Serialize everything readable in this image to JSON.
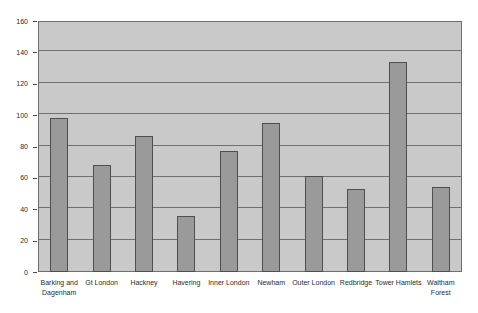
{
  "chart_data": {
    "type": "bar",
    "title": "",
    "subtitle": "",
    "xlabel": "",
    "ylabel": "",
    "categories": [
      "Barking and Dagenham",
      "Gt London",
      "Hackney",
      "Havering",
      "Inner London",
      "Newham",
      "Outer London",
      "Redbridge",
      "Tower Hamlets",
      "Waltham Forest"
    ],
    "values": [
      98,
      68,
      87,
      36,
      77,
      95,
      61,
      53,
      134,
      54
    ],
    "ylim": [
      0,
      160
    ],
    "ytick_step": 20,
    "yticks": [
      0,
      20,
      40,
      60,
      80,
      100,
      120,
      140,
      160
    ],
    "ytick_labels": [
      "0",
      "20",
      "40",
      "60",
      "80",
      "100",
      "120",
      "140",
      "160"
    ],
    "grid": true,
    "grid_axis": "y",
    "legend": false,
    "legend_position": "none",
    "bar_fill_color": "#9a9a9a",
    "bar_border_color": "#4f4f4f",
    "plot_background_color": "#c9c9c9",
    "gridline_color": "#6f6f6f",
    "figure_background_color": "#ffffff",
    "text_color": "#2b2b2b"
  }
}
